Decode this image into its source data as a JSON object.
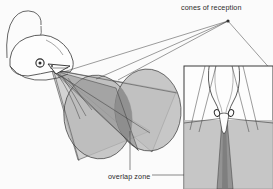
{
  "figure": {
    "type": "scientific-diagram",
    "background_color": "#fbfbfb",
    "ink_color": "#2a2a2a",
    "fill_light_gray": "#b9b9b9",
    "fill_dark_gray": "#8d8d8d",
    "fill_white": "#fdfdfd"
  },
  "labels": {
    "cones_of_reception": "cones of reception",
    "overlap_zone": "overlap zone"
  },
  "annotations": {
    "apex_point": {
      "x": 228,
      "y": 21
    },
    "leader_count": 4
  },
  "inset": {
    "name": "frontal-view-inset",
    "x": 184,
    "y": 66,
    "width": 89,
    "height": 123,
    "border_color": "#3a3a3a",
    "band_top": 120
  },
  "cones": [
    {
      "name": "left-cone",
      "cx": 98,
      "cy": 117,
      "rx": 34,
      "ry": 42,
      "rotation": -8
    },
    {
      "name": "right-cone",
      "cx": 148,
      "cy": 110,
      "rx": 33,
      "ry": 41,
      "rotation": -4
    }
  ],
  "head": {
    "name": "bird-head-profile",
    "eye": {
      "cx": 40,
      "cy": 63,
      "r": 4
    },
    "beak_tip": {
      "x": 52,
      "y": 72
    }
  },
  "inset_eyes": [
    {
      "cx": 217,
      "cy": 113,
      "r": 3.2
    },
    {
      "cx": 231,
      "cy": 113,
      "r": 3.2
    }
  ]
}
